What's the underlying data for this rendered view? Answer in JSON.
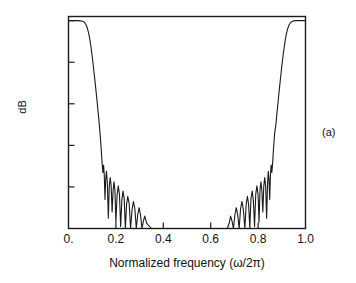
{
  "figure": {
    "panel_annotation": "(a)",
    "line_color": "#1a1a1a",
    "axis_color": "#1a1a1a",
    "background": "#ffffff"
  },
  "chart_data": {
    "type": "line",
    "title": "",
    "subtitle": "",
    "xlabel": "Normalized frequency (ω/2π)",
    "ylabel": "dB",
    "xlim": [
      0.0,
      1.0
    ],
    "ylim": [
      -100.0,
      2.0
    ],
    "grid": false,
    "legend": null,
    "legend_position": "none",
    "annotations": [
      {
        "text": "(a)",
        "position": "right-outside-middle"
      }
    ],
    "xticks": [
      0.0,
      0.2,
      0.4,
      0.6,
      0.8,
      1.0
    ],
    "xticklabels": [
      "0.",
      "0.2",
      "0.4",
      "0.6",
      "0.8",
      "1.0"
    ],
    "yticks": [
      0.0,
      -20.0,
      -40.0,
      -60.0,
      -80.0,
      -100.0
    ],
    "yticklabels": [
      "0.",
      "-20.0",
      "-40.0",
      "-60.0",
      "-80.0",
      "-100.0"
    ],
    "series": [
      {
        "name": "Magnitude response",
        "description": "Bandstop (notch) filter magnitude response, symmetric about 0.5, clipped at -100 dB floor",
        "x": [
          0.0,
          0.01,
          0.02,
          0.03,
          0.04,
          0.05,
          0.06,
          0.065,
          0.07,
          0.075,
          0.08,
          0.085,
          0.09,
          0.095,
          0.1,
          0.105,
          0.11,
          0.115,
          0.12,
          0.125,
          0.13,
          0.133,
          0.136,
          0.139,
          0.142,
          0.145,
          0.148,
          0.151,
          0.154,
          0.157,
          0.16,
          0.164,
          0.168,
          0.172,
          0.176,
          0.18,
          0.184,
          0.188,
          0.192,
          0.196,
          0.2,
          0.205,
          0.21,
          0.215,
          0.22,
          0.225,
          0.23,
          0.235,
          0.24,
          0.245,
          0.25,
          0.256,
          0.262,
          0.268,
          0.274,
          0.28,
          0.286,
          0.292,
          0.298,
          0.304,
          0.31,
          0.316,
          0.322,
          0.33,
          0.35,
          0.4,
          0.45,
          0.5,
          0.55,
          0.6,
          0.65,
          0.67,
          0.678,
          0.684,
          0.69,
          0.696,
          0.702,
          0.708,
          0.714,
          0.72,
          0.726,
          0.732,
          0.738,
          0.744,
          0.75,
          0.755,
          0.76,
          0.765,
          0.77,
          0.775,
          0.78,
          0.785,
          0.79,
          0.795,
          0.8,
          0.804,
          0.808,
          0.812,
          0.816,
          0.82,
          0.824,
          0.828,
          0.832,
          0.836,
          0.84,
          0.843,
          0.846,
          0.849,
          0.852,
          0.855,
          0.858,
          0.861,
          0.864,
          0.867,
          0.87,
          0.875,
          0.88,
          0.885,
          0.89,
          0.895,
          0.9,
          0.905,
          0.91,
          0.915,
          0.92,
          0.925,
          0.93,
          0.935,
          0.94,
          0.95,
          0.96,
          0.97,
          0.98,
          0.99,
          1.0
        ],
        "y": [
          0.0,
          0.0,
          0.0,
          0.0,
          0.0,
          -0.1,
          -0.3,
          -0.6,
          -1.2,
          -2.2,
          -3.8,
          -6.0,
          -9.0,
          -12.8,
          -17.2,
          -22.0,
          -27.2,
          -32.6,
          -38.2,
          -44.0,
          -50.0,
          -54.0,
          -58.5,
          -63.5,
          -69.0,
          -73.0,
          -69.5,
          -74.5,
          -86.0,
          -76.5,
          -72.5,
          -78.0,
          -95.0,
          -80.0,
          -75.5,
          -79.5,
          -92.0,
          -82.0,
          -77.5,
          -81.5,
          -97.0,
          -84.0,
          -79.5,
          -83.5,
          -99.0,
          -86.5,
          -82.0,
          -85.5,
          -100.0,
          -88.5,
          -84.5,
          -88.0,
          -100.0,
          -91.0,
          -87.0,
          -90.5,
          -100.0,
          -93.5,
          -90.0,
          -93.5,
          -100.0,
          -96.5,
          -94.0,
          -97.5,
          -100.0,
          -100.0,
          -100.0,
          -100.0,
          -100.0,
          -100.0,
          -100.0,
          -100.0,
          -97.5,
          -94.0,
          -96.5,
          -100.0,
          -93.5,
          -90.0,
          -93.5,
          -100.0,
          -90.5,
          -87.0,
          -91.0,
          -100.0,
          -88.0,
          -84.5,
          -88.5,
          -100.0,
          -85.5,
          -82.0,
          -86.5,
          -99.0,
          -83.5,
          -79.5,
          -84.0,
          -97.0,
          -81.5,
          -77.5,
          -82.0,
          -92.0,
          -79.5,
          -75.5,
          -80.0,
          -95.0,
          -78.0,
          -72.5,
          -76.5,
          -86.0,
          -74.5,
          -69.5,
          -73.0,
          -69.0,
          -63.5,
          -58.5,
          -54.0,
          -50.0,
          -44.0,
          -38.2,
          -32.6,
          -27.2,
          -22.0,
          -17.2,
          -12.8,
          -9.0,
          -6.0,
          -3.8,
          -2.2,
          -1.2,
          -0.6,
          -0.1,
          0.0,
          0.0,
          0.0,
          0.0,
          0.0
        ]
      }
    ]
  }
}
